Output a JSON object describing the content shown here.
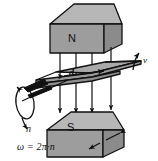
{
  "diagram": {
    "labels": {
      "north_pole": "N",
      "south_pole": "S",
      "gap_distance": "d",
      "velocity": "v",
      "rotation_speed": "n",
      "formula": "ω = 2π·n"
    },
    "colors": {
      "background": "#ffffff",
      "magnet_top_face": "#b4b4b4",
      "magnet_front_face": "#9a9a9a",
      "magnet_side_face": "#8a8a8a",
      "disc_top_face": "#a6a6a6",
      "disc_edge": "#8f8f8f",
      "outline": "#111111",
      "field_line": "#111111"
    },
    "parts": [
      {
        "name": "top-magnet-block",
        "pole": "N"
      },
      {
        "name": "bottom-magnet-block",
        "pole": "S"
      },
      {
        "name": "rotating-disc"
      },
      {
        "name": "rotation-axis-shaft"
      },
      {
        "name": "rotation-ellipse-arrow"
      },
      {
        "name": "magnetic-field-lines",
        "count": 4,
        "direction": "downward"
      },
      {
        "name": "velocity-arrow"
      },
      {
        "name": "gap-dimension-arrow"
      },
      {
        "name": "magnet-face-arrows",
        "count": 2
      }
    ]
  }
}
